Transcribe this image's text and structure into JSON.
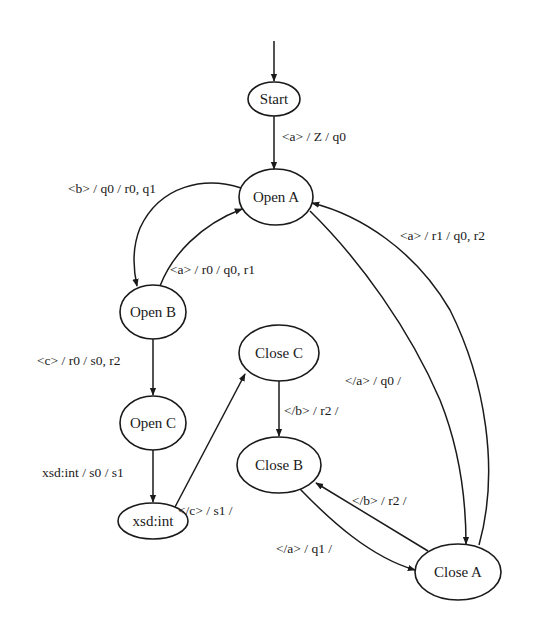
{
  "diagram": {
    "type": "state-machine",
    "colors": {
      "stroke": "#1a1a1a",
      "fill": "#ffffff",
      "background": "#ffffff"
    },
    "nodes": [
      {
        "id": "start",
        "label": "Start"
      },
      {
        "id": "open_a",
        "label": "Open A"
      },
      {
        "id": "open_b",
        "label": "Open B"
      },
      {
        "id": "open_c",
        "label": "Open C"
      },
      {
        "id": "xsd_int",
        "label": "xsd:int"
      },
      {
        "id": "close_c",
        "label": "Close C"
      },
      {
        "id": "close_b",
        "label": "Close B"
      },
      {
        "id": "close_a",
        "label": "Close A"
      }
    ],
    "edges": [
      {
        "from": "initial",
        "to": "start",
        "label": ""
      },
      {
        "from": "start",
        "to": "open_a",
        "label": "<a> / Z / q0"
      },
      {
        "from": "open_a",
        "to": "open_b",
        "label": "<b> / q0 / r0, q1"
      },
      {
        "from": "open_b",
        "to": "open_a",
        "label": "<a> / r0 / q0, r1"
      },
      {
        "from": "close_a",
        "to": "open_a",
        "label": "<a> / r1 / q0, r2"
      },
      {
        "from": "open_b",
        "to": "open_c",
        "label": "<c> / r0 / s0, r2"
      },
      {
        "from": "open_a",
        "to": "close_a",
        "label": "</a> / q0 /"
      },
      {
        "from": "open_c",
        "to": "xsd_int",
        "label": "xsd:int / s0 / s1"
      },
      {
        "from": "xsd_int",
        "to": "close_c",
        "label": "</c> / s1 /"
      },
      {
        "from": "close_c",
        "to": "close_b",
        "label": "</b> / r2 /"
      },
      {
        "from": "close_a",
        "to": "close_b",
        "label": "</b> / r2 /"
      },
      {
        "from": "close_b",
        "to": "close_a",
        "label": "</a> / q1 /"
      }
    ]
  }
}
